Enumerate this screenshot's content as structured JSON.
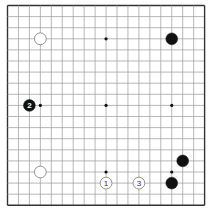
{
  "board": {
    "size": 19,
    "origin_x": 7.5,
    "origin_y": 5.5,
    "spacing_x": 10.95,
    "spacing_y": 11.1,
    "line_color": "#999999",
    "edge_color": "#333333",
    "background": "#ffffff",
    "star_points": [
      [
        3,
        3
      ],
      [
        9,
        3
      ],
      [
        15,
        3
      ],
      [
        3,
        9
      ],
      [
        9,
        9
      ],
      [
        15,
        9
      ],
      [
        3,
        15
      ],
      [
        9,
        15
      ],
      [
        15,
        15
      ]
    ],
    "hidden_star_points": [
      [
        3,
        3
      ],
      [
        15,
        3
      ],
      [
        3,
        15
      ],
      [
        15,
        15
      ]
    ]
  },
  "stones": [
    {
      "color": "white",
      "col": 3,
      "row": 3,
      "label": ""
    },
    {
      "color": "black",
      "col": 15,
      "row": 3,
      "label": ""
    },
    {
      "color": "black",
      "col": 2,
      "row": 9,
      "label": "2"
    },
    {
      "color": "white",
      "col": 3,
      "row": 15,
      "label": ""
    },
    {
      "color": "black",
      "col": 16,
      "row": 14,
      "label": ""
    },
    {
      "color": "black",
      "col": 15,
      "row": 16,
      "label": ""
    },
    {
      "color": "white",
      "col": 9,
      "row": 16,
      "label": "1"
    },
    {
      "color": "white",
      "col": 12,
      "row": 16,
      "label": "3"
    }
  ],
  "colors": {
    "black_stone": "#111111",
    "white_stone_fill": "#ffffff",
    "white_stone_stroke": "#888888",
    "black_label": "#ffffff",
    "white_label": "#333333",
    "hoshi": "#111111"
  }
}
